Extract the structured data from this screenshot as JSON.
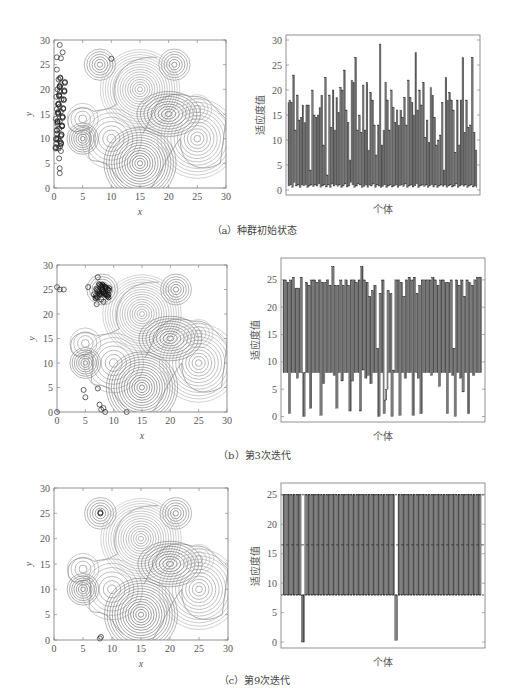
{
  "figure": {
    "panels": [
      {
        "id": "a",
        "caption": "（a）种群初始状态",
        "contour": {
          "xlabel": "x",
          "ylabel": "y",
          "xticks": [
            "0",
            "5",
            "10",
            "15",
            "20",
            "25",
            "30"
          ],
          "yticks": [
            "0",
            "5",
            "10",
            "15",
            "20",
            "25",
            "30"
          ],
          "box": [
            54,
            40,
            226,
            188
          ]
        },
        "bars": {
          "xlabel": "个体",
          "ylabel": "适应度值",
          "yticks": [
            "0",
            "5",
            "10",
            "15",
            "20",
            "25",
            "30"
          ],
          "ymax": 30,
          "box": [
            286,
            35,
            480,
            195
          ]
        }
      },
      {
        "id": "b",
        "caption": "（b）第3次迭代",
        "contour": {
          "xlabel": "x",
          "ylabel": "y",
          "xticks": [
            "0",
            "5",
            "10",
            "15",
            "20",
            "25",
            "30"
          ],
          "yticks": [
            "0",
            "5",
            "10",
            "15",
            "20",
            "25",
            "30"
          ],
          "box": [
            57,
            265,
            227,
            412
          ]
        },
        "bars": {
          "xlabel": "个体",
          "ylabel": "适应度值",
          "yticks": [
            "0",
            "5",
            "10",
            "15",
            "20",
            "25"
          ],
          "ymax": 28,
          "box": [
            281,
            258,
            485,
            422
          ]
        }
      },
      {
        "id": "c",
        "caption": "（c）第9次迭代",
        "contour": {
          "xlabel": "x",
          "ylabel": "y",
          "xticks": [
            "0",
            "5",
            "10",
            "15",
            "20",
            "25",
            "30"
          ],
          "yticks": [
            "0",
            "5",
            "10",
            "15",
            "20",
            "25",
            "30"
          ],
          "box": [
            54,
            488,
            228,
            640
          ]
        },
        "bars": {
          "xlabel": "个体",
          "ylabel": "适应度值",
          "yticks": [
            "0",
            "5",
            "10",
            "15",
            "20",
            "25"
          ],
          "ymax": 26,
          "box": [
            281,
            483,
            485,
            648
          ]
        }
      }
    ]
  },
  "chart_data": [
    {
      "type": "scatter",
      "title": "（a）种群初始状态 - contour with population",
      "xlabel": "x",
      "ylabel": "y",
      "xlim": [
        0,
        30
      ],
      "ylim": [
        0,
        30
      ],
      "peaks": [
        [
          8,
          25
        ],
        [
          21,
          25
        ],
        [
          15,
          20
        ],
        [
          20,
          15
        ],
        [
          25,
          16
        ],
        [
          5,
          14
        ],
        [
          5,
          10
        ],
        [
          10,
          10
        ],
        [
          15,
          5
        ],
        [
          25,
          10
        ]
      ],
      "population_description": "points clustered at x≈0-2, y≈3-29",
      "population": [
        [
          1,
          29
        ],
        [
          1.5,
          27.5
        ],
        [
          0.5,
          26.5
        ],
        [
          1.2,
          26.3
        ],
        [
          0.5,
          24
        ],
        [
          0.8,
          22
        ],
        [
          1.2,
          21
        ],
        [
          0.6,
          20
        ],
        [
          1,
          19.5
        ],
        [
          0.4,
          18.5
        ],
        [
          1.3,
          18
        ],
        [
          0.7,
          17
        ],
        [
          1,
          16.5
        ],
        [
          0.5,
          16
        ],
        [
          1.2,
          15.5
        ],
        [
          0.8,
          15
        ],
        [
          0.3,
          14
        ],
        [
          1,
          13.5
        ],
        [
          0.6,
          13
        ],
        [
          1.4,
          12.5
        ],
        [
          0.9,
          12
        ],
        [
          0.5,
          11
        ],
        [
          1.2,
          10.5
        ],
        [
          0.7,
          10
        ],
        [
          1,
          9.5
        ],
        [
          0.4,
          9
        ],
        [
          1.1,
          8.5
        ],
        [
          0.8,
          8
        ],
        [
          1.2,
          7.5
        ],
        [
          0.9,
          6
        ],
        [
          1,
          4
        ],
        [
          1,
          3
        ]
      ]
    },
    {
      "type": "bar",
      "title": "（a）种群初始状态 - fitness",
      "xlabel": "个体",
      "ylabel": "适应度值",
      "ylim": [
        -1,
        31
      ],
      "values": [
        17.5,
        0.8,
        18,
        1,
        17.5,
        0.5,
        23,
        1.5,
        12,
        0.8,
        19,
        1,
        14,
        0.5,
        14.5,
        1,
        17,
        0.8,
        13.5,
        1,
        17,
        0.5,
        17,
        0.8,
        4,
        1,
        20,
        0.7,
        15,
        1,
        14.5,
        0.8,
        15,
        1.2,
        16.5,
        0.5,
        19,
        0.8,
        9,
        1,
        22.5,
        0.6,
        3,
        1,
        19,
        0.5,
        12.5,
        1.2,
        20,
        0.8,
        12,
        1,
        18.5,
        0.7,
        15.5,
        1,
        20.5,
        0.5,
        20,
        0.8,
        24,
        1.2,
        16,
        0.6,
        13.5,
        0.8,
        6,
        1.5,
        22,
        1,
        21.5,
        0.5,
        26.5,
        0.8,
        12,
        1.2,
        15,
        1,
        11.5,
        0.5,
        21,
        0.7,
        12,
        1,
        21.5,
        0.5,
        8,
        1,
        19.5,
        0.8,
        18,
        1.2,
        13,
        0.5,
        7,
        1,
        13,
        0.8,
        29.2,
        0.5,
        9,
        0.7,
        12,
        1,
        21.5,
        0.5,
        18,
        0.8,
        12,
        1,
        20,
        0.6,
        16.5,
        0.8,
        13.5,
        1,
        16,
        0.5,
        13,
        0.8,
        16,
        1,
        14.5,
        0.7,
        18.5,
        1.2,
        13,
        0.5,
        22,
        0.8,
        18.5,
        1,
        17.5,
        0.6,
        15,
        0.8,
        27.5,
        1.2,
        16,
        0.5,
        20,
        0.8,
        17,
        1,
        21.5,
        0.7,
        10.5,
        1,
        14,
        0.5,
        9.5,
        0.8,
        20.5,
        1,
        19,
        0.6,
        14.5,
        1,
        9,
        0.5,
        10,
        0.8,
        11,
        1,
        17.5,
        0.7,
        4,
        1,
        22.5,
        0.5,
        18,
        0.8,
        19.5,
        1,
        18,
        0.6,
        16,
        0.8,
        7.5,
        1.2,
        18,
        0.5,
        9,
        0.8,
        18,
        1,
        26.5,
        0.7,
        11.5,
        1,
        18,
        0.5,
        12.5,
        0.8,
        13,
        1,
        26.5,
        0.6,
        11.5,
        0.8,
        8,
        0.5
      ]
    },
    {
      "type": "scatter",
      "title": "（b）第3次迭代 - contour with population",
      "xlabel": "x",
      "ylabel": "y",
      "xlim": [
        0,
        30
      ],
      "ylim": [
        0,
        30
      ],
      "population_description": "dense cluster near (8,25), few points near (0,25), (0,0), (5,4), (8,0), (12,0)",
      "population": [
        [
          0,
          25.5
        ],
        [
          0.5,
          25
        ],
        [
          1.2,
          25
        ],
        [
          7.2,
          27.5
        ],
        [
          5.5,
          25.5
        ],
        [
          8,
          25
        ],
        [
          8.2,
          24.5
        ],
        [
          7.5,
          24
        ],
        [
          8.5,
          25.5
        ],
        [
          7.8,
          23
        ],
        [
          8.2,
          22.5
        ],
        [
          7,
          22
        ],
        [
          6.5,
          24
        ],
        [
          8.8,
          24
        ],
        [
          4.7,
          4.5
        ],
        [
          5,
          3
        ],
        [
          7.2,
          4.8
        ],
        [
          7.5,
          1.5
        ],
        [
          7.8,
          0.5
        ],
        [
          8.2,
          0.8
        ],
        [
          8.5,
          0
        ],
        [
          12.3,
          0
        ],
        [
          0,
          0
        ]
      ]
    },
    {
      "type": "bar",
      "title": "（b）第3次迭代 - fitness",
      "xlabel": "个体",
      "ylabel": "适应度值",
      "ylim": [
        -1,
        28
      ],
      "values": [
        25,
        8,
        25,
        8,
        24.5,
        0.5,
        25,
        8,
        25.5,
        8,
        23.5,
        7,
        23.5,
        8,
        25.5,
        8,
        0,
        8,
        24.5,
        8,
        24,
        1.5,
        25,
        8,
        25,
        8,
        24.5,
        8,
        25,
        0.2,
        24.5,
        6,
        24.5,
        8,
        25,
        8,
        24,
        8,
        27.5,
        7.5,
        24,
        1.5,
        24,
        8,
        25,
        6.5,
        24,
        8,
        25,
        8,
        24,
        1,
        25,
        6.5,
        25,
        8,
        24.5,
        8,
        25,
        1,
        27.5,
        8.5,
        25,
        7,
        24.5,
        7.5,
        22,
        6,
        23,
        8,
        24,
        8,
        12.5,
        0,
        22.5,
        8,
        25,
        0.5,
        3,
        5,
        23,
        8,
        22.5,
        0,
        8.5,
        8,
        25,
        8,
        25,
        0.2,
        24.5,
        8,
        22,
        7,
        25,
        8,
        25.5,
        8,
        25,
        0.2,
        25.5,
        8,
        22.5,
        7,
        24,
        0.5,
        25,
        8,
        25,
        8,
        25,
        8,
        25,
        7.5,
        25.5,
        8,
        25,
        8,
        24,
        5.5,
        25,
        8,
        25,
        8,
        24.5,
        0.5,
        24.5,
        8,
        25,
        7.5,
        12.5,
        0,
        25,
        8,
        24,
        7,
        25,
        4.5,
        22,
        8,
        25,
        0.5,
        24.5,
        8,
        24,
        7.5,
        25,
        8,
        25.5,
        8,
        25.5,
        8
      ]
    },
    {
      "type": "scatter",
      "title": "（c）第9次迭代 - contour with population",
      "xlabel": "x",
      "ylabel": "y",
      "xlim": [
        0,
        30
      ],
      "ylim": [
        0,
        30
      ],
      "population_description": "points converged at (8,25) and near (8,0)",
      "population": [
        [
          8,
          25
        ],
        [
          8,
          25.2
        ],
        [
          7.9,
          0.3
        ],
        [
          8.1,
          0.6
        ]
      ]
    },
    {
      "type": "bar",
      "title": "（c）第9次迭代 - fitness",
      "xlabel": "个体",
      "ylabel": "适应度值",
      "ylim": [
        -1,
        26
      ],
      "reference_line": 16.5,
      "values_description": "alternating bars between ~8 and 25 across all individuals, with two individuals dropping to 0 (around positions 10% and 57%)",
      "high_value": 25,
      "low_value": 8,
      "outliers": [
        {
          "position_frac": 0.1,
          "value": 0
        },
        {
          "position_frac": 0.57,
          "value": 0.3
        }
      ]
    }
  ]
}
